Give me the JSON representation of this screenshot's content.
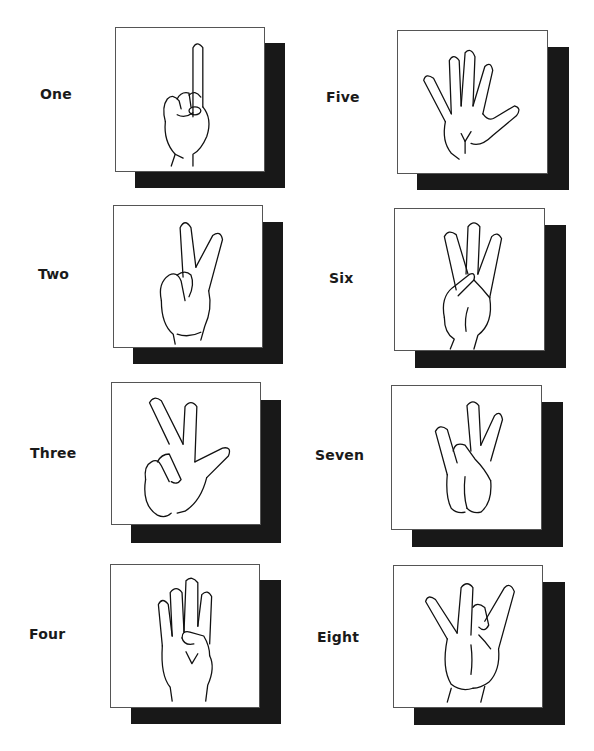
{
  "signs": [
    {
      "label": "One",
      "icon": "hand-one-finger-icon"
    },
    {
      "label": "Two",
      "icon": "hand-two-fingers-icon"
    },
    {
      "label": "Three",
      "icon": "hand-three-fingers-icon"
    },
    {
      "label": "Four",
      "icon": "hand-four-fingers-icon"
    },
    {
      "label": "Five",
      "icon": "hand-five-fingers-icon"
    },
    {
      "label": "Six",
      "icon": "hand-six-sign-icon"
    },
    {
      "label": "Seven",
      "icon": "hand-seven-sign-icon"
    },
    {
      "label": "Eight",
      "icon": "hand-eight-sign-icon"
    }
  ],
  "colors": {
    "shadow": "#181818",
    "card_border": "#555555",
    "text": "#1a1a1a"
  }
}
